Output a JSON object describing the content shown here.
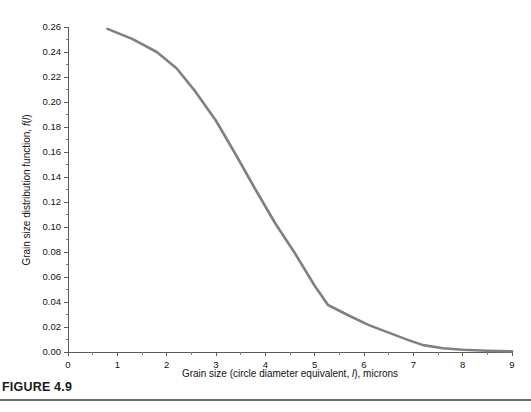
{
  "figure": {
    "caption": "FIGURE 4.9",
    "rule_color": "#6e6e6e"
  },
  "chart_data": {
    "type": "line",
    "title": "",
    "xlabel_parts": {
      "pre": "Grain size (circle diameter equivalent, ",
      "italic": "l",
      "post": "), microns"
    },
    "xlabel": "Grain size (circle diameter equivalent, l), microns",
    "ylabel_parts": {
      "pre": "Grain size distribution function, ",
      "italic_f": "f",
      "paren_open": "(",
      "italic_l": "l",
      "paren_close": ")"
    },
    "ylabel": "Grain size distribution function, f(l)",
    "xlim": [
      0,
      9
    ],
    "ylim": [
      0.0,
      0.26
    ],
    "xticks": [
      0,
      1,
      2,
      3,
      4,
      5,
      6,
      7,
      8,
      9
    ],
    "xticklabels": [
      "0",
      "1",
      "2",
      "3",
      "4",
      "5",
      "6",
      "7",
      "8",
      "9"
    ],
    "x_minor_step": 0.5,
    "yticks": [
      0.0,
      0.02,
      0.04,
      0.06,
      0.08,
      0.1,
      0.12,
      0.14,
      0.16,
      0.18,
      0.2,
      0.22,
      0.24,
      0.26
    ],
    "yticklabels": [
      "0.00",
      "0.02",
      "0.04",
      "0.06",
      "0.08",
      "0.10",
      "0.12",
      "0.14",
      "0.16",
      "0.18",
      "0.20",
      "0.22",
      "0.24",
      "0.26"
    ],
    "y_minor_step": 0.01,
    "grid": false,
    "legend": null,
    "line_color": "#808080",
    "line_width": 2.6,
    "series": [
      {
        "name": "grain size distribution",
        "x": [
          0.8,
          1.3,
          1.8,
          2.2,
          2.58,
          3.0,
          3.4,
          3.8,
          4.2,
          4.6,
          5.0,
          5.27,
          5.7,
          6.1,
          6.5,
          6.9,
          7.2,
          7.6,
          8.0,
          8.5,
          9.0
        ],
        "y": [
          0.2585,
          0.2505,
          0.24,
          0.227,
          0.2085,
          0.185,
          0.158,
          0.13,
          0.103,
          0.079,
          0.053,
          0.0376,
          0.029,
          0.0215,
          0.0155,
          0.0095,
          0.0055,
          0.003,
          0.0018,
          0.001,
          0.0005
        ]
      }
    ]
  },
  "axes_geometry": {
    "x_px_min": 68,
    "x_px_max": 512,
    "y_px_min": 352,
    "y_px_max": 27
  }
}
